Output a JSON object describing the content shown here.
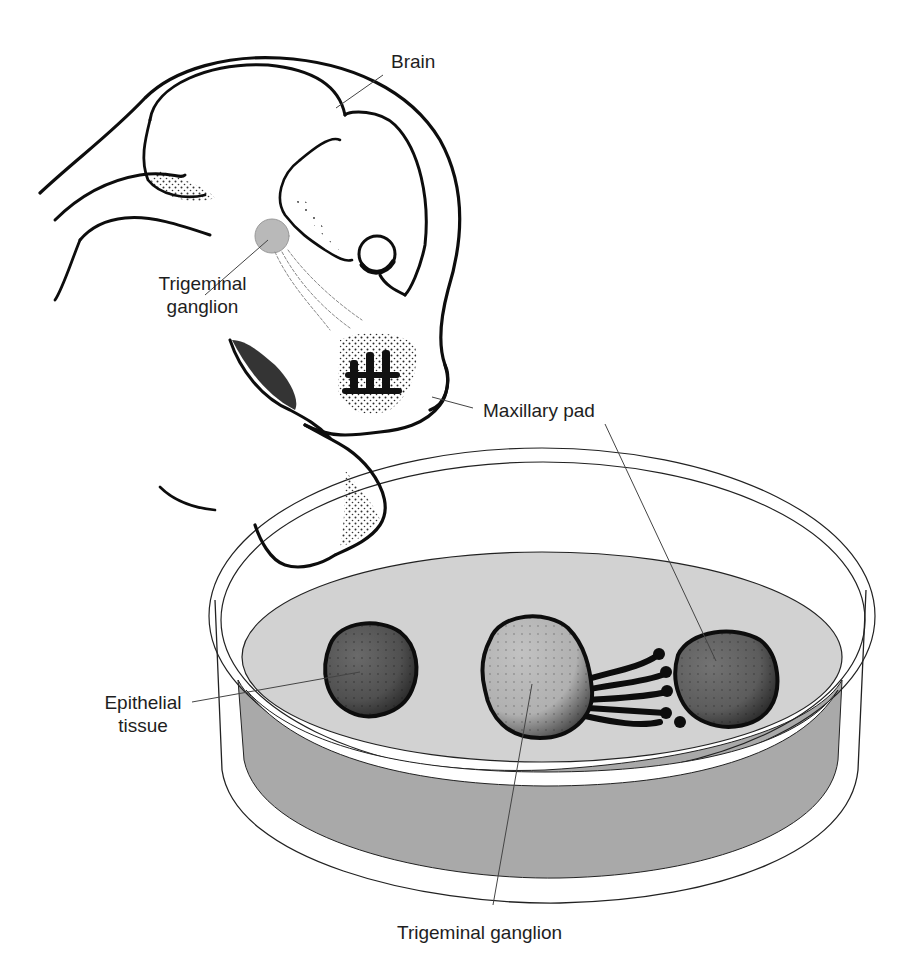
{
  "figure": {
    "type": "biological-illustration",
    "labels": {
      "brain": "Brain",
      "trigeminal_ganglion_embryo_line1": "Trigeminal",
      "trigeminal_ganglion_embryo_line2": "ganglion",
      "maxillary_pad": "Maxillary pad",
      "epithelial_tissue_line1": "Epithelial",
      "epithelial_tissue_line2": "tissue",
      "trigeminal_ganglion_dish": "Trigeminal ganglion"
    },
    "colors": {
      "ink": "#111111",
      "label_text": "#1e1e1e",
      "leader_line": "#444444",
      "ganglion_embryo_fill": "#b9b9b9",
      "dish_medium_top": "#d2d2d2",
      "dish_medium_side": "#a9a9a9",
      "epithelial_fill": "#5a5a5a",
      "ganglion_dish_fill": "#b4b4b4",
      "maxillary_explant_fill": "#666666"
    }
  }
}
